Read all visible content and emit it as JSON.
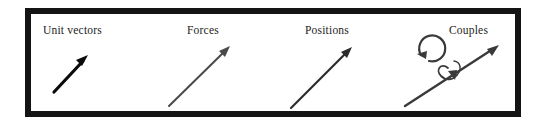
{
  "figure": {
    "frame": {
      "border_color": "#141414",
      "background": "#ffffff",
      "border_width_px": 6
    },
    "panels": [
      {
        "id": "unit-vectors",
        "label": "Unit vectors",
        "label_left_px": 12,
        "panel_left_px": 25,
        "panel_width_px": 120,
        "arrow": {
          "kind": "straight-arrow",
          "color": "#0b0b0b",
          "stroke_width_px": 3.2,
          "x1": 23,
          "y1": 78,
          "x2": 56,
          "y2": 43,
          "head_length_px": 11,
          "head_width_px": 8
        },
        "has_curved_arrow": false,
        "has_spin_loop": false
      },
      {
        "id": "forces",
        "label": "Forces",
        "label_left_px": 36,
        "panel_left_px": 145,
        "panel_width_px": 120,
        "arrow": {
          "kind": "straight-arrow",
          "color": "#4a4a4a",
          "stroke_width_px": 2.0,
          "x1": 18,
          "y1": 92,
          "x2": 78,
          "y2": 33,
          "head_length_px": 12,
          "head_width_px": 7
        },
        "has_curved_arrow": false,
        "has_spin_loop": false
      },
      {
        "id": "positions",
        "label": "Positions",
        "label_left_px": 34,
        "panel_left_px": 265,
        "panel_width_px": 120,
        "arrow": {
          "kind": "straight-arrow",
          "color": "#2b2b2b",
          "stroke_width_px": 2.2,
          "x1": 20,
          "y1": 94,
          "x2": 80,
          "y2": 34,
          "head_length_px": 12,
          "head_width_px": 7
        },
        "has_curved_arrow": false,
        "has_spin_loop": false
      },
      {
        "id": "couples",
        "label": "Couples",
        "label_left_px": 58,
        "panel_left_px": 385,
        "panel_width_px": 136,
        "arrow": {
          "kind": "straight-arrow",
          "color": "#3a3a3a",
          "stroke_width_px": 2.4,
          "x1": 44,
          "y1": 99,
          "x2": 112,
          "y2": 32,
          "head_length_px": 13,
          "head_width_px": 8
        },
        "has_curved_arrow": true,
        "curved_arrow": {
          "kind": "circular-arrow-ccw",
          "color": "#3a3a3a",
          "stroke_width_px": 2.2,
          "center_x": 30,
          "center_y": 54,
          "radius_px": 13
        },
        "has_spin_loop": true,
        "spin_loop": {
          "kind": "spin-loop-about-axis",
          "color": "#3a3a3a",
          "stroke_width_px": 1.8,
          "center_x": 76,
          "center_y": 60
        }
      }
    ]
  }
}
